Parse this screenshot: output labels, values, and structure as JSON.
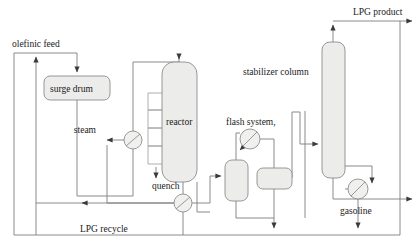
{
  "diagram": {
    "type": "process-flow-diagram",
    "canvas": {
      "width": 420,
      "height": 250
    },
    "palette": {
      "background": "#ffffff",
      "line": "#7d7d7d",
      "vessel_fill": "#ececeb",
      "vessel_stroke": "#8d8d8d",
      "text": "#1a1a1a"
    }
  },
  "labels": {
    "olefinic_feed": "olefinic feed",
    "surge_drum": "surge drum",
    "steam": "steam",
    "reactor": "reactor",
    "quench": "quench",
    "flash_system": "flash system,",
    "stabilizer_column": "stabilizer column",
    "lpg_product": "LPG product",
    "gasoline": "gasoline",
    "lpg_recycle": "LPG recycle"
  },
  "equipment": [
    {
      "id": "surge-drum",
      "name": "surge drum",
      "shape": "rounded-rect",
      "x": 44,
      "y": 76,
      "width": 66,
      "height": 24
    },
    {
      "id": "reactor",
      "name": "reactor",
      "shape": "rounded-rect-tall",
      "x": 162,
      "y": 62,
      "width": 35,
      "height": 120
    },
    {
      "id": "flash-drum",
      "name": "flash drum",
      "shape": "rounded-rect-tall",
      "x": 225,
      "y": 160,
      "width": 23,
      "height": 41
    },
    {
      "id": "separator-vessel",
      "name": "separator vessel",
      "shape": "rounded-rect",
      "x": 257,
      "y": 168,
      "width": 35,
      "height": 21
    },
    {
      "id": "stabilizer-column",
      "name": "stabilizer column",
      "shape": "rounded-rect-tall",
      "x": 322,
      "y": 42,
      "width": 23,
      "height": 136
    },
    {
      "id": "steam-exchanger",
      "name": "steam heat exchanger",
      "shape": "circle",
      "cx": 133,
      "cy": 140,
      "r": 9
    },
    {
      "id": "quench-pump",
      "name": "quench pump",
      "shape": "circle",
      "cx": 183,
      "cy": 203,
      "r": 9
    },
    {
      "id": "flash-exchanger",
      "name": "flash system exchanger",
      "shape": "circle-slash",
      "cx": 250,
      "cy": 139,
      "r": 10
    },
    {
      "id": "gasoline-cooler",
      "name": "gasoline cooler",
      "shape": "circle-slash",
      "cx": 358,
      "cy": 189,
      "r": 10
    }
  ],
  "streams": [
    {
      "id": "olefinic-feed",
      "label": "olefinic feed",
      "from": "feed-inlet",
      "to": "surge-drum"
    },
    {
      "id": "lpg-recycle",
      "label": "LPG recycle",
      "from": "bottom-header",
      "to": "feed-line"
    },
    {
      "id": "surge-to-reactor",
      "label": "",
      "from": "surge-drum",
      "to": "reactor"
    },
    {
      "id": "steam-stream",
      "label": "steam",
      "from": "steam-exchanger",
      "to": "steam-outlet"
    },
    {
      "id": "quench-stream",
      "label": "quench",
      "from": "reactor-bottom",
      "to": "quench-pump"
    },
    {
      "id": "reactor-to-flash",
      "label": "",
      "from": "reactor",
      "to": "flash-drum"
    },
    {
      "id": "flash-overhead",
      "label": "flash system,",
      "from": "flash-drum",
      "to": "flash-exchanger"
    },
    {
      "id": "flash-to-stabilizer",
      "label": "",
      "from": "separator-vessel",
      "to": "stabilizer-column"
    },
    {
      "id": "lpg-product",
      "label": "LPG product",
      "from": "stabilizer-column-overhead",
      "to": "product-outlet"
    },
    {
      "id": "gasoline-stream",
      "label": "gasoline",
      "from": "stabilizer-column-bottom",
      "to": "gasoline-cooler"
    }
  ]
}
